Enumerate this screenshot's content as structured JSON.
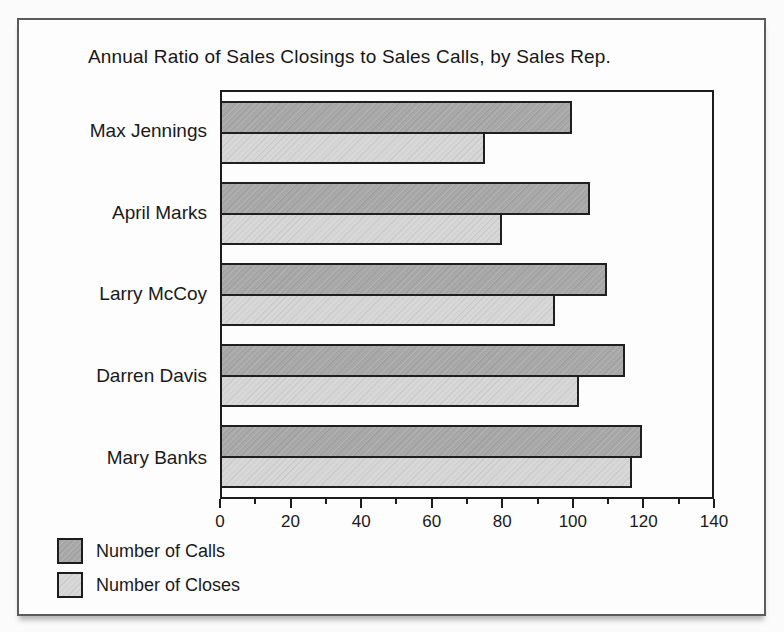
{
  "figure": {
    "title": "Annual Ratio of Sales Closings to Sales Calls, by Sales Rep."
  },
  "chart_data": {
    "type": "bar",
    "orientation": "horizontal",
    "title": "Annual Ratio of Sales Closings to Sales Calls, by Sales Rep.",
    "categories": [
      "Max Jennings",
      "April Marks",
      "Larry McCoy",
      "Darren Davis",
      "Mary Banks"
    ],
    "series": [
      {
        "name": "Number of Calls",
        "color": "#a8a8a8",
        "values": [
          100,
          105,
          110,
          115,
          120
        ]
      },
      {
        "name": "Number of Closes",
        "color": "#d6d6d6",
        "values": [
          75,
          80,
          95,
          102,
          117
        ]
      }
    ],
    "xlabel": "",
    "ylabel": "",
    "xlim": [
      0,
      140
    ],
    "x_ticks_major": [
      0,
      20,
      40,
      60,
      80,
      100,
      120,
      140
    ],
    "x_ticks_minor": [
      10,
      30,
      50,
      70,
      90,
      110,
      130
    ],
    "grid": false,
    "legend_position": "bottom-left",
    "bar_border_color": "#1f1f1f"
  },
  "legend": {
    "items": [
      {
        "label": "Number of Calls",
        "color": "#a8a8a8"
      },
      {
        "label": "Number of Closes",
        "color": "#d6d6d6"
      }
    ]
  }
}
